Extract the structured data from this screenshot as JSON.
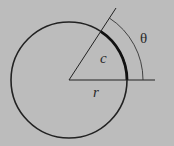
{
  "diagram": {
    "type": "geometry",
    "background": "#bcbcbc",
    "stroke_color": "#222222",
    "labels": {
      "theta": "θ",
      "arc": "c",
      "radius": "r"
    },
    "geometry": {
      "center": [
        69,
        80
      ],
      "circle_radius": 58,
      "angle_marker_radius": 74,
      "angle_degrees": 57,
      "radial_line_length": 86,
      "baseline_length": 86
    }
  }
}
